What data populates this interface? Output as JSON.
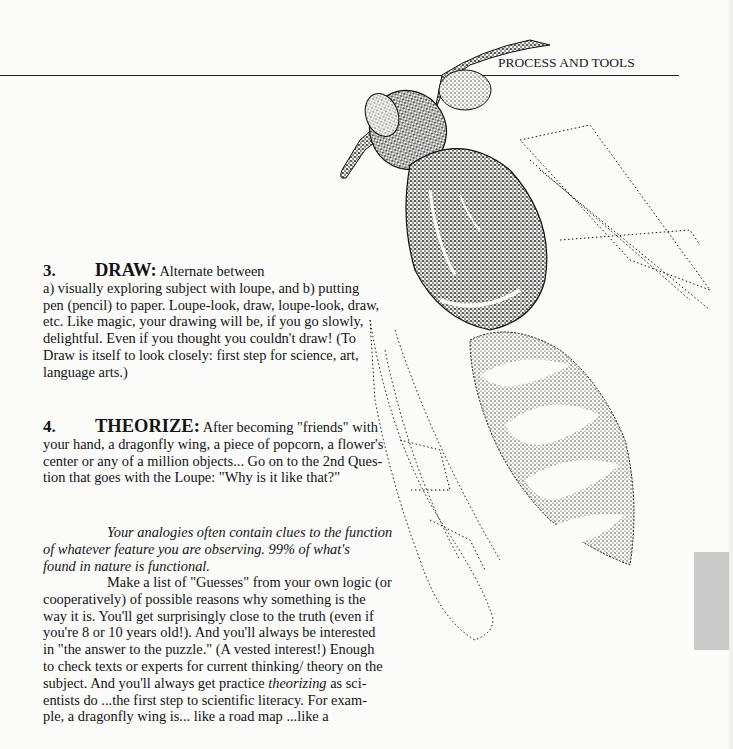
{
  "header": {
    "running_head": "PROCESS AND TOOLS"
  },
  "section3": {
    "number": "3.",
    "keyword": "DRAW:",
    "lead": " Alternate between",
    "lines": [
      "a)  visually exploring subject with loupe, and  b)  putting",
      "pen (pencil) to paper.  Loupe-look, draw, loupe-look, draw,",
      "etc.   Like magic, your drawing will be, if you go slowly,",
      "delightful.   Even if you thought you couldn't draw!   (To",
      "Draw is itself to look closely:  first step for science, art,",
      "language arts.)"
    ]
  },
  "section4": {
    "number": "4.",
    "keyword": "THEORIZE:",
    "lead": " After becoming \"friends\" with",
    "lines": [
      "your hand, a dragonfly wing, a piece of popcorn, a flower's",
      "center or any of a million objects... Go on to the 2nd Ques-",
      "tion that goes with the Loupe:   \"Why is it like that?\""
    ]
  },
  "italic_paragraph": {
    "lines": [
      "Your analogies often contain clues to the function",
      "of whatever feature you are observing.   99% of what's",
      "found in nature is functional."
    ]
  },
  "guesses_paragraph": {
    "lines": [
      "Make a list of \"Guesses\" from your own logic (or",
      "cooperatively) of possible reasons why something is the",
      "way it is.   You'll get surprisingly close to the truth (even if",
      "you're 8 or 10 years old!).   And you'll always be interested",
      "in \"the answer to the puzzle.\"  (A vested interest!) Enough",
      "to check texts or experts for current thinking/ theory on the"
    ],
    "line7_before": "subject.   And you'll always get practice ",
    "line7_italic": "theorizing",
    "line7_after": " as sci-",
    "lines_end": [
      "entists do ...the first step to scientific literacy.  For exam-",
      "ple, a dragonfly wing is... like a road map ...like a"
    ]
  },
  "illustration": {
    "subject": "wasp stipple drawing"
  },
  "colors": {
    "page": "#fbfbfa",
    "ink": "#141414",
    "side_tab": "#c9c9c9"
  }
}
